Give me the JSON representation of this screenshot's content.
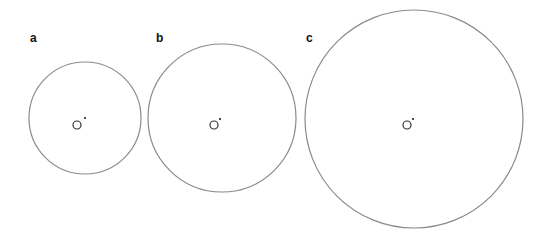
{
  "panels": [
    {
      "label": "a",
      "label_x": 30,
      "label_y": 32,
      "cx": 85,
      "cy": 118,
      "r": 56,
      "inner_cx": 77,
      "inner_cy": 125,
      "inner_r": 4,
      "dot_cx": 85,
      "dot_cy": 118
    },
    {
      "label": "b",
      "label_x": 156,
      "label_y": 32,
      "cx": 222,
      "cy": 118,
      "r": 74,
      "inner_cx": 214,
      "inner_cy": 125,
      "inner_r": 4,
      "dot_cx": 220,
      "dot_cy": 119
    },
    {
      "label": "c",
      "label_x": 306,
      "label_y": 32,
      "cx": 414,
      "cy": 119,
      "r": 109,
      "inner_cx": 407,
      "inner_cy": 125,
      "inner_r": 4,
      "dot_cx": 413,
      "dot_cy": 119
    }
  ],
  "colors": {
    "outer_stroke": "#8a8a8a",
    "inner_stroke": "#333333",
    "dot": "#111111"
  }
}
